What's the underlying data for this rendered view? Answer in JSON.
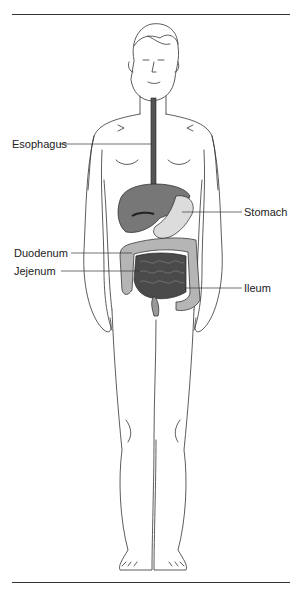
{
  "figure": {
    "title_fragment": "",
    "labels": {
      "esophagus": "Esophagus",
      "stomach": "Stomach",
      "duodenum": "Duodenum",
      "jejenum": "Jejenum",
      "ileum": "Ileum"
    },
    "colors": {
      "line": "#333333",
      "liver": "#777777",
      "stomach": "#d8d8d8",
      "small_intestine": "#4a4a4a",
      "large_intestine": "#b0b0b0",
      "esophagus": "#555555"
    }
  }
}
